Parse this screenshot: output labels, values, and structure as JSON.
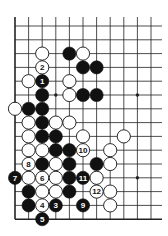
{
  "diagram": {
    "board": {
      "columns": 11,
      "rows": 15,
      "edges": [
        "left",
        "bottom"
      ],
      "star_points": [
        [
          3,
          5
        ],
        [
          9,
          5
        ],
        [
          9,
          11
        ]
      ]
    },
    "colors": {
      "black_stone": "#111111",
      "white_stone": "#ffffff",
      "line": "#222222",
      "background": "#ffffff"
    },
    "stones": [
      {
        "color": "white",
        "col": 2,
        "row": 2,
        "label": ""
      },
      {
        "color": "black",
        "col": 4,
        "row": 2,
        "label": ""
      },
      {
        "color": "white",
        "col": 5,
        "row": 2,
        "label": ""
      },
      {
        "color": "white",
        "col": 2,
        "row": 3,
        "label": "2"
      },
      {
        "color": "black",
        "col": 5,
        "row": 3,
        "label": ""
      },
      {
        "color": "black",
        "col": 6,
        "row": 3,
        "label": ""
      },
      {
        "color": "white",
        "col": 1,
        "row": 4,
        "label": ""
      },
      {
        "color": "black",
        "col": 2,
        "row": 4,
        "label": "1"
      },
      {
        "color": "white",
        "col": 4,
        "row": 4,
        "label": ""
      },
      {
        "color": "black",
        "col": 2,
        "row": 5,
        "label": ""
      },
      {
        "color": "white",
        "col": 4,
        "row": 5,
        "label": ""
      },
      {
        "color": "black",
        "col": 5,
        "row": 5,
        "label": ""
      },
      {
        "color": "black",
        "col": 6,
        "row": 5,
        "label": ""
      },
      {
        "color": "white",
        "col": 0,
        "row": 6,
        "label": ""
      },
      {
        "color": "black",
        "col": 1,
        "row": 6,
        "label": ""
      },
      {
        "color": "black",
        "col": 2,
        "row": 6,
        "label": ""
      },
      {
        "color": "white",
        "col": 1,
        "row": 7,
        "label": ""
      },
      {
        "color": "black",
        "col": 2,
        "row": 7,
        "label": ""
      },
      {
        "color": "white",
        "col": 3,
        "row": 7,
        "label": ""
      },
      {
        "color": "white",
        "col": 4,
        "row": 7,
        "label": ""
      },
      {
        "color": "white",
        "col": 1,
        "row": 8,
        "label": ""
      },
      {
        "color": "black",
        "col": 2,
        "row": 8,
        "label": ""
      },
      {
        "color": "black",
        "col": 3,
        "row": 8,
        "label": ""
      },
      {
        "color": "white",
        "col": 5,
        "row": 8,
        "label": ""
      },
      {
        "color": "white",
        "col": 8,
        "row": 8,
        "label": ""
      },
      {
        "color": "white",
        "col": 1,
        "row": 9,
        "label": ""
      },
      {
        "color": "white",
        "col": 2,
        "row": 9,
        "label": ""
      },
      {
        "color": "black",
        "col": 3,
        "row": 9,
        "label": ""
      },
      {
        "color": "black",
        "col": 4,
        "row": 9,
        "label": ""
      },
      {
        "color": "white",
        "col": 5,
        "row": 9,
        "label": "10"
      },
      {
        "color": "white",
        "col": 7,
        "row": 9,
        "label": ""
      },
      {
        "color": "white",
        "col": 1,
        "row": 10,
        "label": "8"
      },
      {
        "color": "black",
        "col": 2,
        "row": 10,
        "label": ""
      },
      {
        "color": "white",
        "col": 3,
        "row": 10,
        "label": ""
      },
      {
        "color": "black",
        "col": 4,
        "row": 10,
        "label": ""
      },
      {
        "color": "black",
        "col": 6,
        "row": 10,
        "label": ""
      },
      {
        "color": "white",
        "col": 7,
        "row": 10,
        "label": ""
      },
      {
        "color": "black",
        "col": 0,
        "row": 11,
        "label": "7"
      },
      {
        "color": "white",
        "col": 1,
        "row": 11,
        "label": ""
      },
      {
        "color": "white",
        "col": 2,
        "row": 11,
        "label": "6"
      },
      {
        "color": "white",
        "col": 3,
        "row": 11,
        "label": ""
      },
      {
        "color": "black",
        "col": 4,
        "row": 11,
        "label": ""
      },
      {
        "color": "black",
        "col": 5,
        "row": 11,
        "label": "11"
      },
      {
        "color": "white",
        "col": 6,
        "row": 11,
        "label": ""
      },
      {
        "color": "black",
        "col": 1,
        "row": 12,
        "label": ""
      },
      {
        "color": "white",
        "col": 2,
        "row": 12,
        "label": ""
      },
      {
        "color": "white",
        "col": 3,
        "row": 12,
        "label": ""
      },
      {
        "color": "black",
        "col": 4,
        "row": 12,
        "label": ""
      },
      {
        "color": "white",
        "col": 6,
        "row": 12,
        "label": "12"
      },
      {
        "color": "white",
        "col": 7,
        "row": 12,
        "label": ""
      },
      {
        "color": "black",
        "col": 1,
        "row": 13,
        "label": ""
      },
      {
        "color": "white",
        "col": 2,
        "row": 13,
        "label": "4"
      },
      {
        "color": "black",
        "col": 3,
        "row": 13,
        "label": "3"
      },
      {
        "color": "black",
        "col": 5,
        "row": 13,
        "label": "9"
      },
      {
        "color": "white",
        "col": 7,
        "row": 13,
        "label": ""
      },
      {
        "color": "black",
        "col": 2,
        "row": 14,
        "label": "5"
      }
    ]
  }
}
